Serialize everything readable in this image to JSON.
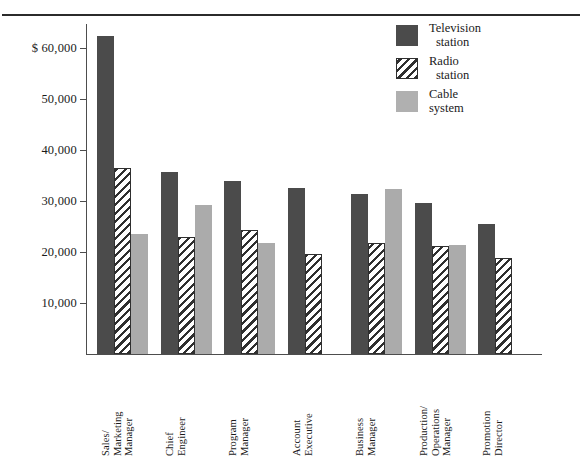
{
  "figure": {
    "title_fragment": "",
    "currency_prefix": "$"
  },
  "legend": {
    "position": "top-right",
    "items": [
      {
        "name": "television-station",
        "line1": "Television",
        "line2": "station",
        "color": "#4b4b4b",
        "pattern": "solid"
      },
      {
        "name": "radio-station",
        "line1": "Radio",
        "line2": "station",
        "color": "#ffffff",
        "pattern": "diagonal-hatch"
      },
      {
        "name": "cable-system",
        "line1": "Cable",
        "line2": "system",
        "color": "#b0b0b0",
        "pattern": "solid"
      }
    ]
  },
  "axis": {
    "y_ticks": [
      {
        "value": 60000,
        "label": "$ 60,000"
      },
      {
        "value": 50000,
        "label": "50,000"
      },
      {
        "value": 40000,
        "label": "40,000"
      },
      {
        "value": 30000,
        "label": "30,000"
      },
      {
        "value": 20000,
        "label": "20,000"
      },
      {
        "value": 10000,
        "label": "10,000"
      }
    ]
  },
  "chart_data": {
    "type": "bar",
    "title": "",
    "xlabel": "",
    "ylabel": "",
    "ylim": [
      0,
      65000
    ],
    "ytick_values": [
      10000,
      20000,
      30000,
      40000,
      50000,
      60000
    ],
    "ytick_labels": [
      "10,000",
      "20,000",
      "30,000",
      "40,000",
      "50,000",
      "$ 60,000"
    ],
    "grid": false,
    "legend_position": "top-right",
    "categories": [
      "Sales/ Marketing Manager",
      "Chief Engineer",
      "Program Manager",
      "Account Executive",
      "Business Manager",
      "Production/ Operations Manager",
      "Promotion Director"
    ],
    "category_lines": [
      [
        "Sales/",
        "Marketing",
        "Manager"
      ],
      [
        "Chief",
        "Engineer"
      ],
      [
        "Program",
        "Manager"
      ],
      [
        "Account",
        "Executive"
      ],
      [
        "Business",
        "Manager"
      ],
      [
        "Production/",
        "Operations",
        "Manager"
      ],
      [
        "Promotion",
        "Director"
      ]
    ],
    "series": [
      {
        "name": "Television station",
        "color": "#4b4b4b",
        "values": [
          62400,
          35700,
          34000,
          32500,
          31300,
          29700,
          25400
        ]
      },
      {
        "name": "Radio station",
        "color": "#ffffff",
        "values": [
          36500,
          22900,
          24300,
          19700,
          21700,
          21200,
          18900
        ]
      },
      {
        "name": "Cable system",
        "color": "#b0b0b0",
        "values": [
          23600,
          29200,
          21700,
          null,
          32300,
          21300,
          null
        ]
      }
    ]
  }
}
